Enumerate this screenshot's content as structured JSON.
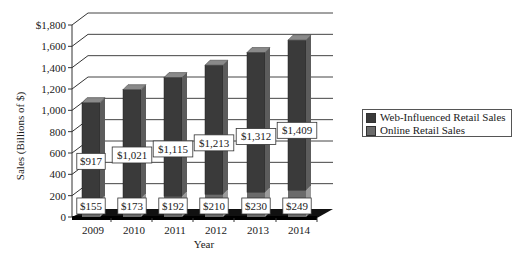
{
  "chart_data": {
    "type": "bar",
    "stacked": true,
    "style": "3d",
    "title": "",
    "xlabel": "Year",
    "ylabel": "Sales (Billions of $)",
    "ylim": [
      0,
      1800
    ],
    "yticks": [
      "0",
      "200",
      "400",
      "600",
      "800",
      "1,000",
      "1,200",
      "1,400",
      "1,600",
      "$1,800"
    ],
    "categories": [
      "2009",
      "2010",
      "2011",
      "2012",
      "2013",
      "2014"
    ],
    "series": [
      {
        "name": "Online Retail Sales",
        "values": [
          155,
          173,
          192,
          210,
          230,
          249
        ],
        "labels": [
          "$155",
          "$173",
          "$192",
          "$210",
          "$230",
          "$249"
        ],
        "color": "#6b6b6b"
      },
      {
        "name": "Web-Influenced Retail Sales",
        "values": [
          917,
          1021,
          1115,
          1213,
          1312,
          1409
        ],
        "labels": [
          "$917",
          "$1,021",
          "$1,115",
          "$1,213",
          "$1,312",
          "$1,409"
        ],
        "color": "#3a3a3a"
      }
    ],
    "grid": true,
    "legend_position": "right"
  },
  "legend": {
    "items": [
      {
        "label": "Web-Influenced Retail Sales",
        "color": "#3a3a3a"
      },
      {
        "label": "Online Retail Sales",
        "color": "#6b6b6b"
      }
    ]
  }
}
